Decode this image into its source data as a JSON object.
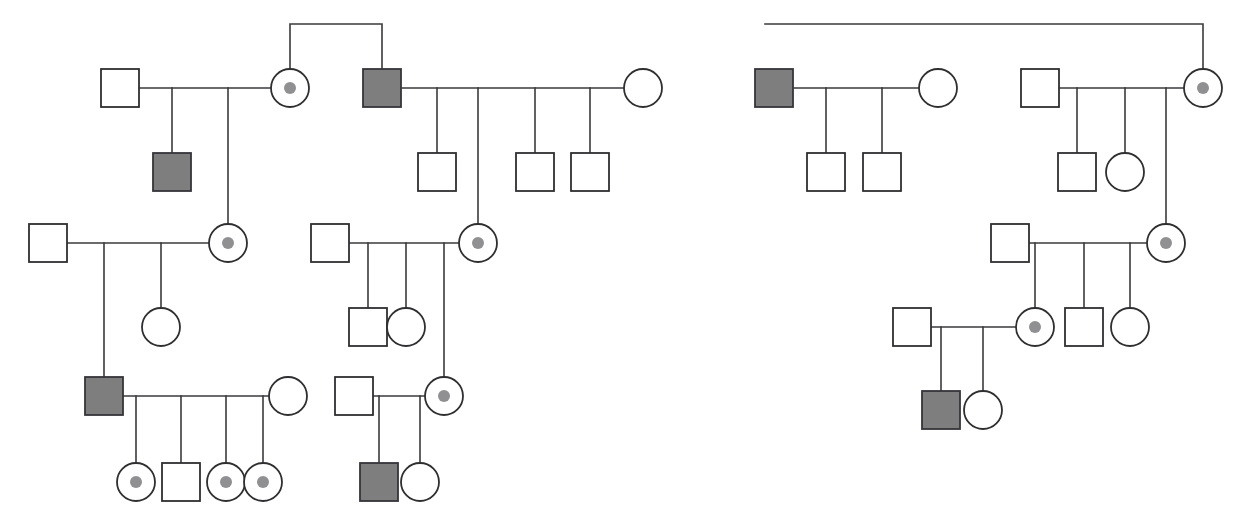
{
  "figure": {
    "kind": "pedigree-chart",
    "width": 1235,
    "height": 513,
    "background_color": "#ffffff",
    "line_color": "#3a3a3c",
    "symbol_stroke_color": "#2f2f31",
    "affected_fill_color": "#7e7e7e",
    "carrier_dot_color": "#909093",
    "legend_semantics": {
      "square": "male",
      "circle": "female",
      "filled": "affected",
      "center-dot": "carrier"
    }
  },
  "chart_data": {
    "type": "diagram",
    "diagram_type": "pedigree",
    "counts": {
      "individuals": 41,
      "males": 21,
      "females": 20,
      "affected": 6,
      "carriers": 11,
      "unaffected_unmarked": 24
    },
    "symbol_geometry": {
      "square_size": 38,
      "circle_radius": 19,
      "carrier_dot_radius": 6
    },
    "nodes": [
      {
        "id": "n01",
        "shape": "square",
        "status": "unaffected",
        "sex": "male",
        "cx": 120,
        "cy": 88,
        "group": "left-family-A",
        "generation": 1
      },
      {
        "id": "n02",
        "shape": "circle",
        "status": "carrier",
        "sex": "female",
        "cx": 290,
        "cy": 88,
        "group": "left-family-A",
        "generation": 1
      },
      {
        "id": "n03",
        "shape": "square",
        "status": "affected",
        "sex": "male",
        "cx": 172,
        "cy": 172,
        "group": "left-family-A",
        "generation": 2
      },
      {
        "id": "n04",
        "shape": "square",
        "status": "affected",
        "sex": "male",
        "cx": 382,
        "cy": 88,
        "group": "left-family-B",
        "generation": 1
      },
      {
        "id": "n05",
        "shape": "circle",
        "status": "unaffected",
        "sex": "female",
        "cx": 643,
        "cy": 88,
        "group": "left-family-B",
        "generation": 1
      },
      {
        "id": "n06",
        "shape": "square",
        "status": "unaffected",
        "sex": "male",
        "cx": 437,
        "cy": 172,
        "group": "left-family-B",
        "generation": 2
      },
      {
        "id": "n07",
        "shape": "square",
        "status": "unaffected",
        "sex": "male",
        "cx": 535,
        "cy": 172,
        "group": "left-family-B",
        "generation": 2
      },
      {
        "id": "n08",
        "shape": "square",
        "status": "unaffected",
        "sex": "male",
        "cx": 590,
        "cy": 172,
        "group": "left-family-B",
        "generation": 2
      },
      {
        "id": "n09",
        "shape": "square",
        "status": "unaffected",
        "sex": "male",
        "cx": 48,
        "cy": 243,
        "group": "left-family-C",
        "generation": 2
      },
      {
        "id": "n10",
        "shape": "circle",
        "status": "carrier",
        "sex": "female",
        "cx": 228,
        "cy": 243,
        "group": "left-family-C",
        "generation": 2
      },
      {
        "id": "n11",
        "shape": "circle",
        "status": "unaffected",
        "sex": "female",
        "cx": 161,
        "cy": 327,
        "group": "left-family-C",
        "generation": 3
      },
      {
        "id": "n12",
        "shape": "square",
        "status": "affected",
        "sex": "male",
        "cx": 104,
        "cy": 396,
        "group": "left-family-D",
        "generation": 3
      },
      {
        "id": "n13",
        "shape": "circle",
        "status": "unaffected",
        "sex": "female",
        "cx": 288,
        "cy": 396,
        "group": "left-family-D",
        "generation": 3
      },
      {
        "id": "n14",
        "shape": "circle",
        "status": "carrier",
        "sex": "female",
        "cx": 136,
        "cy": 482,
        "group": "left-family-D",
        "generation": 4
      },
      {
        "id": "n15",
        "shape": "square",
        "status": "unaffected",
        "sex": "male",
        "cx": 181,
        "cy": 482,
        "group": "left-family-D",
        "generation": 4
      },
      {
        "id": "n16",
        "shape": "circle",
        "status": "carrier",
        "sex": "female",
        "cx": 226,
        "cy": 482,
        "group": "left-family-D",
        "generation": 4
      },
      {
        "id": "n17",
        "shape": "circle",
        "status": "carrier",
        "sex": "female",
        "cx": 263,
        "cy": 482,
        "group": "left-family-D",
        "generation": 4
      },
      {
        "id": "n18",
        "shape": "square",
        "status": "unaffected",
        "sex": "male",
        "cx": 330,
        "cy": 243,
        "group": "mid-family-E",
        "generation": 2
      },
      {
        "id": "n19",
        "shape": "circle",
        "status": "carrier",
        "sex": "female",
        "cx": 478,
        "cy": 243,
        "group": "mid-family-E",
        "generation": 2
      },
      {
        "id": "n20",
        "shape": "square",
        "status": "unaffected",
        "sex": "male",
        "cx": 368,
        "cy": 327,
        "group": "mid-family-E",
        "generation": 3
      },
      {
        "id": "n21",
        "shape": "circle",
        "status": "unaffected",
        "sex": "female",
        "cx": 406,
        "cy": 327,
        "group": "mid-family-E",
        "generation": 3
      },
      {
        "id": "n22",
        "shape": "square",
        "status": "unaffected",
        "sex": "male",
        "cx": 354,
        "cy": 396,
        "group": "mid-family-F",
        "generation": 3
      },
      {
        "id": "n23",
        "shape": "circle",
        "status": "carrier",
        "sex": "female",
        "cx": 444,
        "cy": 396,
        "group": "mid-family-F",
        "generation": 3
      },
      {
        "id": "n24",
        "shape": "square",
        "status": "affected",
        "sex": "male",
        "cx": 379,
        "cy": 482,
        "group": "mid-family-F",
        "generation": 4
      },
      {
        "id": "n25",
        "shape": "circle",
        "status": "unaffected",
        "sex": "female",
        "cx": 420,
        "cy": 482,
        "group": "mid-family-F",
        "generation": 4
      },
      {
        "id": "n26",
        "shape": "square",
        "status": "affected",
        "sex": "male",
        "cx": 774,
        "cy": 88,
        "group": "right-family-G",
        "generation": 1
      },
      {
        "id": "n27",
        "shape": "circle",
        "status": "unaffected",
        "sex": "female",
        "cx": 938,
        "cy": 88,
        "group": "right-family-G",
        "generation": 1
      },
      {
        "id": "n28",
        "shape": "square",
        "status": "unaffected",
        "sex": "male",
        "cx": 826,
        "cy": 172,
        "group": "right-family-G",
        "generation": 2
      },
      {
        "id": "n29",
        "shape": "square",
        "status": "unaffected",
        "sex": "male",
        "cx": 882,
        "cy": 172,
        "group": "right-family-G",
        "generation": 2
      },
      {
        "id": "n30",
        "shape": "square",
        "status": "unaffected",
        "sex": "male",
        "cx": 1040,
        "cy": 88,
        "group": "right-family-H",
        "generation": 1
      },
      {
        "id": "n31",
        "shape": "circle",
        "status": "carrier",
        "sex": "female",
        "cx": 1203,
        "cy": 88,
        "group": "right-family-H",
        "generation": 1
      },
      {
        "id": "n32",
        "shape": "square",
        "status": "unaffected",
        "sex": "male",
        "cx": 1077,
        "cy": 172,
        "group": "right-family-H",
        "generation": 2
      },
      {
        "id": "n33",
        "shape": "circle",
        "status": "unaffected",
        "sex": "female",
        "cx": 1125,
        "cy": 172,
        "group": "right-family-H",
        "generation": 2
      },
      {
        "id": "n34",
        "shape": "square",
        "status": "unaffected",
        "sex": "male",
        "cx": 1010,
        "cy": 243,
        "group": "right-family-I",
        "generation": 2
      },
      {
        "id": "n35",
        "shape": "circle",
        "status": "carrier",
        "sex": "female",
        "cx": 1166,
        "cy": 243,
        "group": "right-family-I",
        "generation": 2
      },
      {
        "id": "n36",
        "shape": "circle",
        "status": "carrier",
        "sex": "female",
        "cx": 1035,
        "cy": 327,
        "group": "right-family-I",
        "generation": 3
      },
      {
        "id": "n37",
        "shape": "square",
        "status": "unaffected",
        "sex": "male",
        "cx": 1084,
        "cy": 327,
        "group": "right-family-I",
        "generation": 3
      },
      {
        "id": "n38",
        "shape": "circle",
        "status": "unaffected",
        "sex": "female",
        "cx": 1130,
        "cy": 327,
        "group": "right-family-I",
        "generation": 3
      },
      {
        "id": "n39",
        "shape": "square",
        "status": "unaffected",
        "sex": "male",
        "cx": 912,
        "cy": 327,
        "group": "right-family-J",
        "generation": 3
      },
      {
        "id": "n40",
        "shape": "square",
        "status": "affected",
        "sex": "male",
        "cx": 941,
        "cy": 410,
        "group": "right-family-J",
        "generation": 4
      },
      {
        "id": "n41",
        "shape": "circle",
        "status": "unaffected",
        "sex": "female",
        "cx": 983,
        "cy": 410,
        "group": "right-family-J",
        "generation": 4
      }
    ],
    "edges": [
      {
        "kind": "sibship-bracket",
        "group": "left-top",
        "points": "290,70 290,24 382,24 382,69"
      },
      {
        "kind": "sibship-bracket",
        "group": "right-top",
        "points": "765,24 1203,24 1203,69"
      },
      {
        "kind": "mating-line",
        "group": "left-family-A",
        "points": "139,88 271,88"
      },
      {
        "kind": "drop-line",
        "group": "left-family-A",
        "points": "172,88 172,153"
      },
      {
        "kind": "drop-line",
        "group": "left-family-A",
        "points": "228,88 228,224"
      },
      {
        "kind": "mating-line",
        "group": "left-family-B",
        "points": "401,88 624,88"
      },
      {
        "kind": "drop-line",
        "group": "left-family-B",
        "points": "437,88 437,153"
      },
      {
        "kind": "drop-line",
        "group": "left-family-B",
        "points": "478,88 478,224"
      },
      {
        "kind": "drop-line",
        "group": "left-family-B",
        "points": "535,88 535,153"
      },
      {
        "kind": "drop-line",
        "group": "left-family-B",
        "points": "590,88 590,153"
      },
      {
        "kind": "mating-line",
        "group": "left-family-C",
        "points": "67,243 209,243"
      },
      {
        "kind": "drop-line",
        "group": "left-family-C",
        "points": "104,243 104,377"
      },
      {
        "kind": "drop-line",
        "group": "left-family-C",
        "points": "161,243 161,308"
      },
      {
        "kind": "mating-line",
        "group": "left-family-D",
        "points": "123,396 269,396"
      },
      {
        "kind": "drop-line",
        "group": "left-family-D",
        "points": "136,396 136,463"
      },
      {
        "kind": "drop-line",
        "group": "left-family-D",
        "points": "181,396 181,463"
      },
      {
        "kind": "drop-line",
        "group": "left-family-D",
        "points": "226,396 226,463"
      },
      {
        "kind": "drop-line",
        "group": "left-family-D",
        "points": "263,396 263,463"
      },
      {
        "kind": "mating-line",
        "group": "mid-family-E",
        "points": "349,243 459,243"
      },
      {
        "kind": "drop-line",
        "group": "mid-family-E",
        "points": "368,243 368,308"
      },
      {
        "kind": "drop-line",
        "group": "mid-family-E",
        "points": "406,243 406,308"
      },
      {
        "kind": "drop-line",
        "group": "mid-family-E",
        "points": "444,243 444,377"
      },
      {
        "kind": "mating-line",
        "group": "mid-family-F",
        "points": "373,396 425,396"
      },
      {
        "kind": "drop-line",
        "group": "mid-family-F",
        "points": "379,396 379,463"
      },
      {
        "kind": "drop-line",
        "group": "mid-family-F",
        "points": "420,396 420,463"
      },
      {
        "kind": "mating-line",
        "group": "right-family-G",
        "points": "793,88 919,88"
      },
      {
        "kind": "drop-line",
        "group": "right-family-G",
        "points": "826,88 826,153"
      },
      {
        "kind": "drop-line",
        "group": "right-family-G",
        "points": "882,88 882,153"
      },
      {
        "kind": "mating-line",
        "group": "right-family-H",
        "points": "1059,88 1184,88"
      },
      {
        "kind": "drop-line",
        "group": "right-family-H",
        "points": "1077,88 1077,153"
      },
      {
        "kind": "drop-line",
        "group": "right-family-H",
        "points": "1125,88 1125,153"
      },
      {
        "kind": "drop-line",
        "group": "right-family-H",
        "points": "1166,88 1166,224"
      },
      {
        "kind": "mating-line",
        "group": "right-family-I",
        "points": "1029,243 1147,243"
      },
      {
        "kind": "drop-line",
        "group": "right-family-I",
        "points": "1035,243 1035,308"
      },
      {
        "kind": "drop-line",
        "group": "right-family-I",
        "points": "1084,243 1084,308"
      },
      {
        "kind": "drop-line",
        "group": "right-family-I",
        "points": "1130,243 1130,308"
      },
      {
        "kind": "mating-line",
        "group": "right-family-J",
        "points": "931,327 1016,327"
      },
      {
        "kind": "drop-line",
        "group": "right-family-J",
        "points": "941,327 941,391"
      },
      {
        "kind": "drop-line",
        "group": "right-family-J",
        "points": "983,327 983,391"
      }
    ]
  }
}
